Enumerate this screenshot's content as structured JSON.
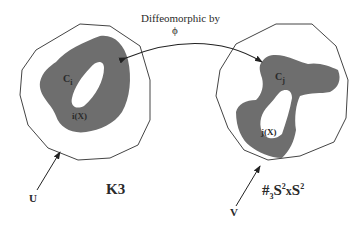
{
  "diagram": {
    "map_label": {
      "line1": "Diffeomorphic by",
      "line2": "ϕ"
    },
    "left_manifold": {
      "name": "K3",
      "region_label_base": "C",
      "region_label_sub": "i",
      "embedded_label": "i(X)",
      "neighborhood_label": "U"
    },
    "right_manifold": {
      "name_prefix": "#",
      "name_sub": "3",
      "name_s1": "S",
      "name_sup1": "2",
      "name_x": "x",
      "name_s2": "S",
      "name_sup2": "2",
      "region_label_base": "C",
      "region_label_sub": "j",
      "embedded_label": "j(X)",
      "neighborhood_label": "V"
    },
    "colors": {
      "outline": "#444444",
      "region_fill": "#6e6e6e",
      "text": "#2a2a2a",
      "background": "#ffffff"
    }
  }
}
